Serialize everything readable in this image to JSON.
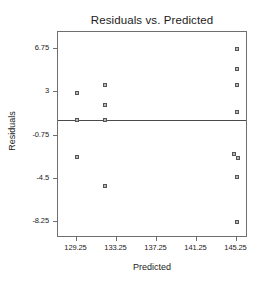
{
  "chart_data": {
    "type": "scatter",
    "title": "Residuals vs. Predicted",
    "xlabel": "Predicted",
    "ylabel": "Residuals",
    "xlim": [
      127.4,
      146.4
    ],
    "ylim": [
      -9.6,
      8.2
    ],
    "grid": false,
    "legend": null,
    "xticks": [
      129.25,
      133.25,
      137.25,
      141.25,
      145.25
    ],
    "xtick_labels": [
      "129.25",
      "133.25",
      "137.25",
      "141.25",
      "145.25"
    ],
    "yticks": [
      6.75,
      3,
      -0.75,
      -4.5,
      -8.25
    ],
    "ytick_labels": [
      "6.75",
      "3",
      "-0.75",
      "-4.5",
      "-8.25"
    ],
    "reference_line": {
      "orientation": "horizontal",
      "y": 0.6,
      "color": "#4a4a4a"
    },
    "marker": {
      "shape": "square",
      "size": 4,
      "edge_color": "#555555",
      "face_color": "#b9b9b9"
    },
    "x": [
      129.25,
      129.25,
      129.25,
      132.1,
      132.1,
      132.1,
      132.1,
      145.25,
      145.25,
      145.25,
      145.25,
      145.0,
      145.35,
      145.25,
      145.25
    ],
    "y": [
      2.95,
      0.6,
      -2.6,
      3.6,
      1.9,
      0.6,
      -5.1,
      6.75,
      5.0,
      3.6,
      1.3,
      -2.35,
      -2.7,
      -4.3,
      -8.25
    ],
    "points": [
      {
        "x": 129.25,
        "y": 2.95
      },
      {
        "x": 129.25,
        "y": 0.6
      },
      {
        "x": 129.25,
        "y": -2.6
      },
      {
        "x": 132.1,
        "y": 3.6
      },
      {
        "x": 132.1,
        "y": 1.9
      },
      {
        "x": 132.1,
        "y": 0.6
      },
      {
        "x": 132.1,
        "y": -5.1
      },
      {
        "x": 145.25,
        "y": 6.75
      },
      {
        "x": 145.25,
        "y": 5.0
      },
      {
        "x": 145.25,
        "y": 3.6
      },
      {
        "x": 145.25,
        "y": 1.3
      },
      {
        "x": 145.0,
        "y": -2.35
      },
      {
        "x": 145.35,
        "y": -2.7
      },
      {
        "x": 145.25,
        "y": -4.3
      },
      {
        "x": 145.25,
        "y": -8.25
      }
    ]
  }
}
